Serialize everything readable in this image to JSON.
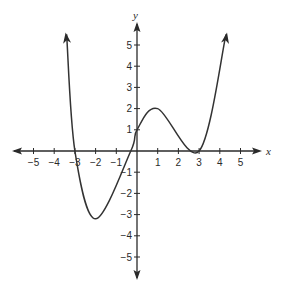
{
  "chart_data": {
    "type": "line",
    "title": "",
    "xlabel": "x",
    "ylabel": "y",
    "xlim": [
      -5.5,
      5.5
    ],
    "ylim": [
      -5.5,
      5.5
    ],
    "grid": false,
    "legend": null,
    "x_ticks": [
      -5,
      -4,
      -3,
      -2,
      -1,
      1,
      2,
      3,
      4,
      5
    ],
    "y_ticks": [
      5,
      4,
      3,
      2,
      1,
      -1,
      -2,
      -3,
      -4,
      -5
    ],
    "x_tick_labels": [
      "−5",
      "−4",
      "−3",
      "−2",
      "−1",
      "1",
      "2",
      "3",
      "4",
      "5"
    ],
    "y_tick_labels": [
      "5",
      "4",
      "3",
      "2",
      "1",
      "−1",
      "−2",
      "−3",
      "−4",
      "−5"
    ],
    "series": [
      {
        "name": "polynomial curve",
        "arrows_at_ends": true,
        "points": [
          {
            "x": -3.4,
            "y": 5.5
          },
          {
            "x": -3.0,
            "y": 0.0
          },
          {
            "x": -2.0,
            "y": -3.2
          },
          {
            "x": -0.3,
            "y": 0.0
          },
          {
            "x": 0.0,
            "y": 1.0
          },
          {
            "x": 1.0,
            "y": 2.0
          },
          {
            "x": 3.0,
            "y": 0.0
          },
          {
            "x": 4.3,
            "y": 5.5
          }
        ]
      }
    ],
    "key_features": {
      "x_intercepts": [
        -3,
        -0.3,
        3
      ],
      "y_intercept": 1,
      "local_minima": [
        {
          "x": -2,
          "y": -3.2
        },
        {
          "x": 3,
          "y": 0
        }
      ],
      "local_maxima": [
        {
          "x": 1,
          "y": 2
        }
      ]
    }
  },
  "axes": {
    "x_name": "x",
    "y_name": "y",
    "color": "#2a2a2a"
  },
  "curve": {
    "color": "#333333"
  }
}
